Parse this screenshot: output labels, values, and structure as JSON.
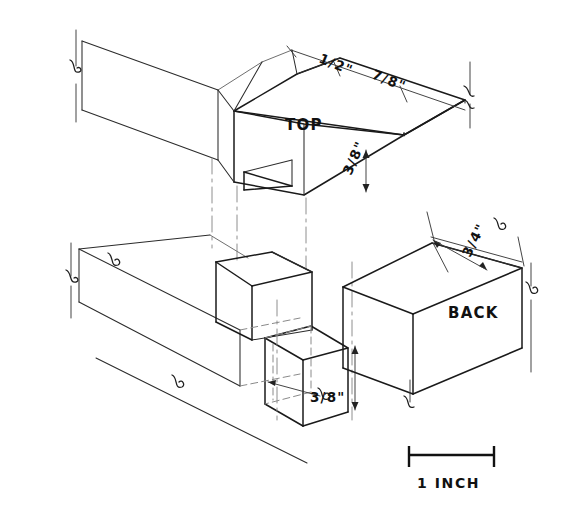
{
  "drawing": {
    "title": "Isometric woodworking joinery sketch",
    "medium": "hand-drawn pencil/ink technical drawing",
    "projection": "isometric exploded view",
    "background_color": "#ffffff",
    "ink_color": "#1a1a1a",
    "parts": [
      {
        "id": "top",
        "label": "TOP",
        "description": "upper horizontal rail with notch / dado cut",
        "position": "upper-center"
      },
      {
        "id": "back",
        "label": "BACK",
        "description": "right-hand rectangular rail block",
        "position": "right-center"
      }
    ],
    "dimensions": [
      {
        "id": "dim-half-inch",
        "value": "1/2\"",
        "applies_to": "top",
        "orientation": "along upper-left edge of TOP rail"
      },
      {
        "id": "dim-seven-eighths",
        "value": "7/8\"",
        "applies_to": "top",
        "orientation": "along upper-right edge of TOP rail"
      },
      {
        "id": "dim-three-eighths-top",
        "value": "3/8\"",
        "applies_to": "top",
        "orientation": "vertical thickness of TOP rail front face"
      },
      {
        "id": "dim-three-quarters",
        "value": "3/4\"",
        "applies_to": "back",
        "orientation": "along top face of BACK block"
      },
      {
        "id": "dim-three-eighths-tenon",
        "value": "3/8\"",
        "applies_to": "lower-assembly",
        "orientation": "vertical height of lower tenon block"
      }
    ],
    "scale": {
      "label": "1 INCH",
      "type": "graphic-scale-bar",
      "length_px": 85
    },
    "annotations": {
      "break_symbols_count": 8,
      "break_symbol_meaning": "conventional break — member continues beyond view"
    }
  }
}
